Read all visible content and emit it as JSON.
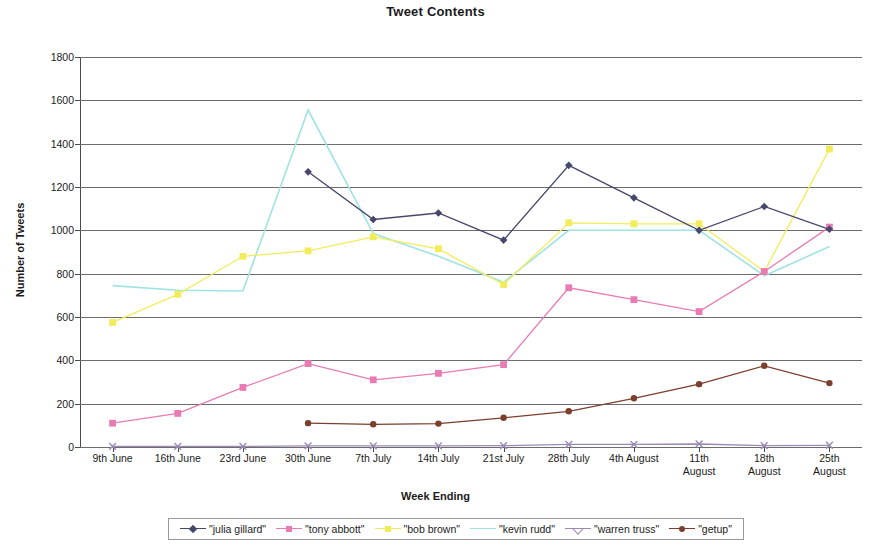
{
  "chart_data": {
    "type": "line",
    "title": "Tweet Contents",
    "xlabel": "Week Ending",
    "ylabel": "Number of Tweets",
    "categories": [
      "9th June",
      "16th June",
      "23rd June",
      "30th June",
      "7th July",
      "14th July",
      "21st July",
      "28th July",
      "4th August",
      "11th\nAugust",
      "18th\nAugust",
      "25th\nAugust"
    ],
    "ylim": [
      0,
      1800
    ],
    "yticks": [
      0,
      200,
      400,
      600,
      800,
      1000,
      1200,
      1400,
      1600,
      1800
    ],
    "grid": true,
    "legend_position": "bottom",
    "series": [
      {
        "name": "\"julia gillard\"",
        "color": "#46476b",
        "marker": "diamond",
        "values": [
          null,
          null,
          null,
          1270,
          1050,
          1080,
          955,
          1300,
          1150,
          1000,
          1110,
          1005
        ]
      },
      {
        "name": "\"tony abbott\"",
        "color": "#e87bb4",
        "marker": "square",
        "values": [
          110,
          155,
          275,
          385,
          310,
          340,
          380,
          735,
          680,
          625,
          810,
          1015
        ]
      },
      {
        "name": "\"bob brown\"",
        "color": "#f3ec5a",
        "marker": "square",
        "values": [
          575,
          705,
          880,
          905,
          970,
          915,
          750,
          1035,
          1030,
          1030,
          810,
          1375
        ]
      },
      {
        "name": "\"kevin rudd\"",
        "color": "#9fe3e3",
        "marker": "none",
        "values": [
          745,
          723,
          720,
          1555,
          985,
          880,
          760,
          1000,
          1000,
          1000,
          790,
          925
        ]
      },
      {
        "name": "\"warren truss\"",
        "color": "#9b8bb4",
        "marker": "cross",
        "values": [
          3,
          3,
          3,
          5,
          5,
          5,
          6,
          12,
          12,
          14,
          6,
          8
        ]
      },
      {
        "name": "\"getup\"",
        "color": "#7b3f2e",
        "marker": "circle",
        "values": [
          null,
          null,
          null,
          110,
          105,
          108,
          135,
          165,
          225,
          290,
          375,
          295
        ]
      }
    ]
  }
}
